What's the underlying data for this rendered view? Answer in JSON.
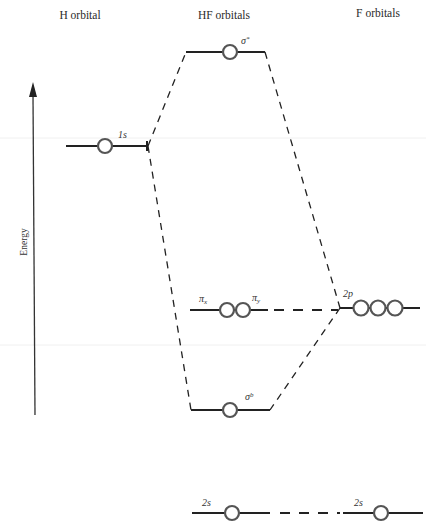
{
  "headers": {
    "left": "H orbital",
    "middle": "HF orbitals",
    "right": "F orbitals"
  },
  "axis": {
    "label": "Energy",
    "direction": "up"
  },
  "levels": {
    "h_1s": {
      "label": "1s",
      "electrons_shown": 1
    },
    "hf_sigma_star": {
      "label": "σ",
      "superscript": "*",
      "electrons_shown": 1
    },
    "hf_pi": {
      "label_x": "π",
      "sub_x": "x",
      "label_y": "π",
      "sub_y": "y",
      "electrons_shown": 2
    },
    "hf_sigma_b": {
      "label": "σ",
      "superscript": "b",
      "electrons_shown": 1
    },
    "hf_2s": {
      "label": "2s",
      "electrons_shown": 1
    },
    "f_2p": {
      "label": "2p",
      "electrons_shown": 3
    },
    "f_2s": {
      "label": "2s",
      "electrons_shown": 1
    }
  },
  "colors": {
    "line": "#222222",
    "orbital_circle": "#555555",
    "background": "#ffffff"
  }
}
